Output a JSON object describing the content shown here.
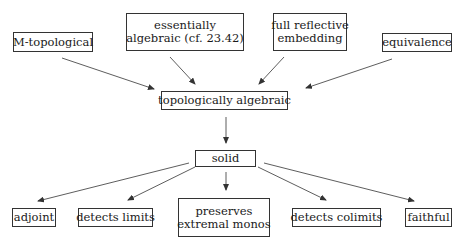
{
  "diagram": {
    "nodes": [
      {
        "id": "m_topological",
        "lines": [
          "M-topological"
        ],
        "x": 13,
        "y": 32,
        "w": 80,
        "h": 20
      },
      {
        "id": "essentially_algebraic",
        "lines": [
          "essentially",
          "algebraic (cf. 23.42)"
        ],
        "x": 126,
        "y": 13,
        "w": 118,
        "h": 38
      },
      {
        "id": "full_reflective_embedding",
        "lines": [
          "full reflective",
          "embedding"
        ],
        "x": 273,
        "y": 13,
        "w": 74,
        "h": 38
      },
      {
        "id": "equivalence",
        "lines": [
          "equivalence"
        ],
        "x": 382,
        "y": 33,
        "w": 70,
        "h": 19
      },
      {
        "id": "topologically_algebraic",
        "lines": [
          "topologically algebraic"
        ],
        "x": 161,
        "y": 91,
        "w": 127,
        "h": 19
      },
      {
        "id": "solid",
        "lines": [
          "solid"
        ],
        "x": 195,
        "y": 150,
        "w": 61,
        "h": 17
      },
      {
        "id": "adjoint",
        "lines": [
          "adjoint"
        ],
        "x": 12,
        "y": 208,
        "w": 44,
        "h": 19
      },
      {
        "id": "detects_limits",
        "lines": [
          "detects limits"
        ],
        "x": 78,
        "y": 208,
        "w": 75,
        "h": 19
      },
      {
        "id": "preserves_extremal_monos",
        "lines": [
          "preserves",
          "extremal monos"
        ],
        "x": 178,
        "y": 198,
        "w": 92,
        "h": 39
      },
      {
        "id": "detects_colimits",
        "lines": [
          "detects colimits"
        ],
        "x": 292,
        "y": 208,
        "w": 89,
        "h": 19
      },
      {
        "id": "faithful",
        "lines": [
          "faithful"
        ],
        "x": 405,
        "y": 208,
        "w": 47,
        "h": 19
      }
    ],
    "edges": [
      {
        "from": "m_topological",
        "to": "topologically_algebraic",
        "x1": 62,
        "y1": 58,
        "x2": 154,
        "y2": 89
      },
      {
        "from": "essentially_algebraic",
        "to": "topologically_algebraic",
        "x1": 170,
        "y1": 57,
        "x2": 195,
        "y2": 84
      },
      {
        "from": "full_reflective_embedding",
        "to": "topologically_algebraic",
        "x1": 284,
        "y1": 57,
        "x2": 259,
        "y2": 84
      },
      {
        "from": "equivalence",
        "to": "topologically_algebraic",
        "x1": 392,
        "y1": 59,
        "x2": 306,
        "y2": 88
      },
      {
        "from": "topologically_algebraic",
        "to": "solid",
        "x1": 226,
        "y1": 117,
        "x2": 226,
        "y2": 143
      },
      {
        "from": "solid",
        "to": "adjoint",
        "x1": 189,
        "y1": 163,
        "x2": 38,
        "y2": 201
      },
      {
        "from": "solid",
        "to": "detects_limits",
        "x1": 195,
        "y1": 167,
        "x2": 128,
        "y2": 200
      },
      {
        "from": "solid",
        "to": "preserves_extremal_monos",
        "x1": 226,
        "y1": 172,
        "x2": 226,
        "y2": 190
      },
      {
        "from": "solid",
        "to": "detects_colimits",
        "x1": 258,
        "y1": 167,
        "x2": 326,
        "y2": 200
      },
      {
        "from": "solid",
        "to": "faithful",
        "x1": 264,
        "y1": 163,
        "x2": 414,
        "y2": 201
      }
    ]
  }
}
